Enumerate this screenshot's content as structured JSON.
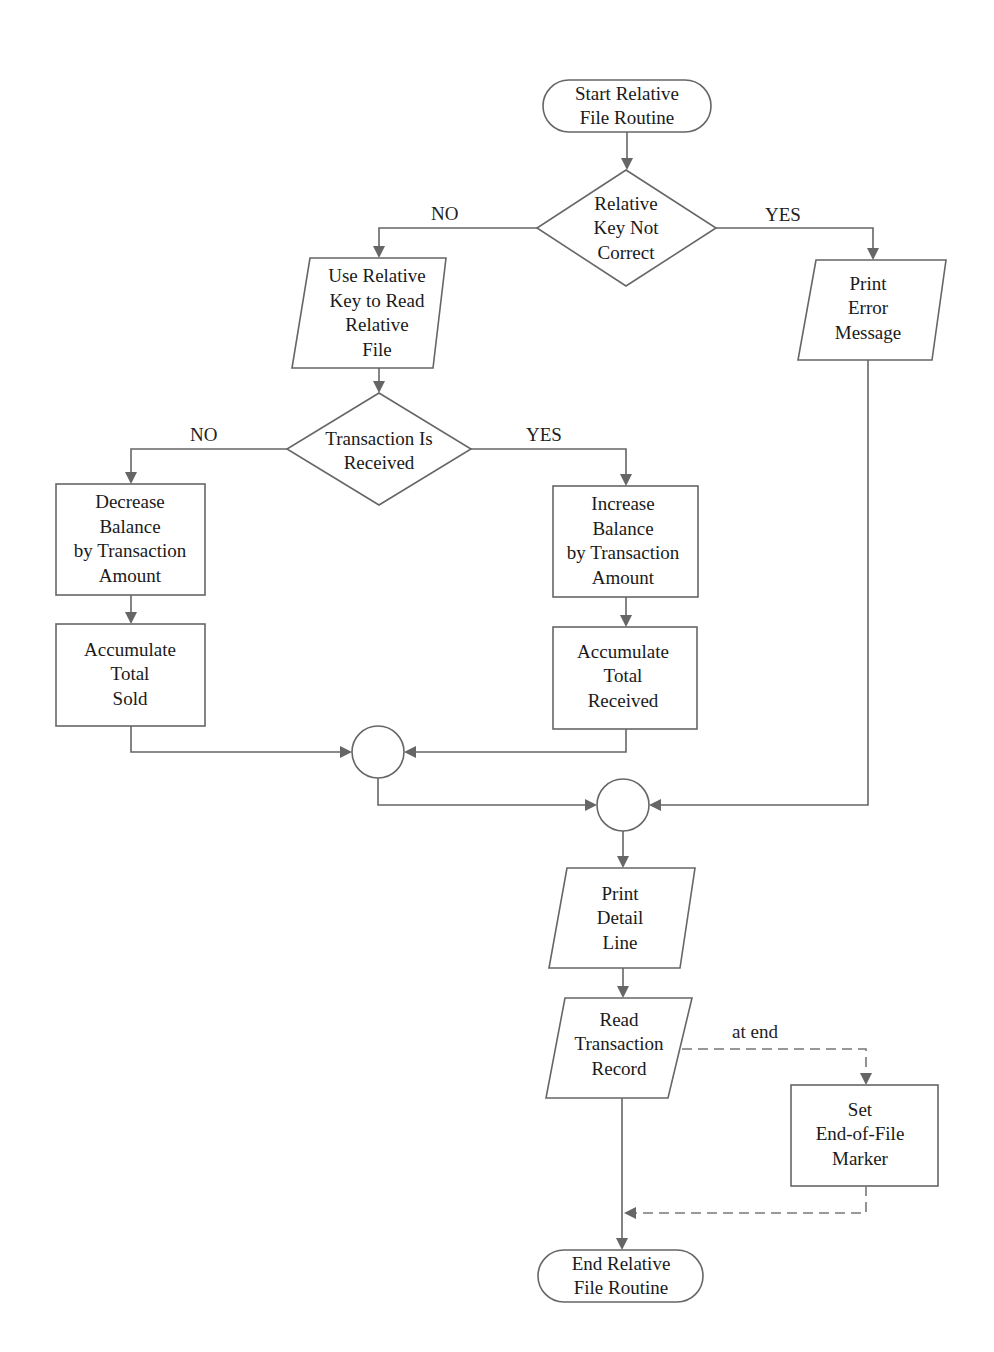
{
  "diagram": {
    "type": "flowchart",
    "nodes": {
      "start": {
        "shape": "terminal",
        "lines": [
          "Start  Relative",
          "File Routine"
        ]
      },
      "key_check": {
        "shape": "decision",
        "lines": [
          "Relative",
          "Key Not",
          "Correct"
        ]
      },
      "read_relative": {
        "shape": "io",
        "lines": [
          "Use Relative",
          "Key to Read",
          "Relative",
          "File"
        ]
      },
      "print_error": {
        "shape": "io",
        "lines": [
          "Print",
          "Error",
          "Message"
        ]
      },
      "trans_check": {
        "shape": "decision",
        "lines": [
          "Transaction Is",
          "Received"
        ]
      },
      "decrease": {
        "shape": "process",
        "lines": [
          "Decrease",
          "Balance",
          "by Transaction",
          "Amount"
        ]
      },
      "increase": {
        "shape": "process",
        "lines": [
          "Increase",
          "Balance",
          "by Transaction",
          "Amount"
        ]
      },
      "acc_sold": {
        "shape": "process",
        "lines": [
          "Accumulate",
          "Total",
          "Sold"
        ]
      },
      "acc_received": {
        "shape": "process",
        "lines": [
          "Accumulate",
          "Total",
          "Received"
        ]
      },
      "connector1": {
        "shape": "connector",
        "lines": []
      },
      "connector2": {
        "shape": "connector",
        "lines": []
      },
      "print_detail": {
        "shape": "io",
        "lines": [
          "Print",
          "Detail",
          "Line"
        ]
      },
      "read_trans": {
        "shape": "io",
        "lines": [
          "Read",
          "Transaction",
          "Record"
        ]
      },
      "set_eof": {
        "shape": "process",
        "lines": [
          "Set",
          "End-of-File",
          "Marker"
        ]
      },
      "end": {
        "shape": "terminal",
        "lines": [
          "End  Relative",
          "File Routine"
        ]
      }
    },
    "edge_labels": {
      "key_no": "NO",
      "key_yes": "YES",
      "trans_no": "NO",
      "trans_yes": "YES",
      "at_end": "at end"
    },
    "edges": [
      {
        "from": "start",
        "to": "key_check"
      },
      {
        "from": "key_check",
        "to": "read_relative",
        "label": "NO"
      },
      {
        "from": "key_check",
        "to": "print_error",
        "label": "YES"
      },
      {
        "from": "read_relative",
        "to": "trans_check"
      },
      {
        "from": "trans_check",
        "to": "decrease",
        "label": "NO"
      },
      {
        "from": "trans_check",
        "to": "increase",
        "label": "YES"
      },
      {
        "from": "decrease",
        "to": "acc_sold"
      },
      {
        "from": "increase",
        "to": "acc_received"
      },
      {
        "from": "acc_sold",
        "to": "connector1"
      },
      {
        "from": "acc_received",
        "to": "connector1"
      },
      {
        "from": "connector1",
        "to": "connector2"
      },
      {
        "from": "print_error",
        "to": "connector2"
      },
      {
        "from": "connector2",
        "to": "print_detail"
      },
      {
        "from": "print_detail",
        "to": "read_trans"
      },
      {
        "from": "read_trans",
        "to": "set_eof",
        "label": "at end",
        "style": "dashed"
      },
      {
        "from": "set_eof",
        "to": "end",
        "style": "dashed"
      },
      {
        "from": "read_trans",
        "to": "end"
      }
    ]
  }
}
